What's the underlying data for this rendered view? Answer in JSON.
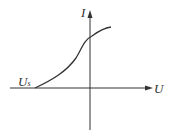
{
  "diagram": {
    "title": "",
    "axes": {
      "x_label": "U",
      "y_label": "I"
    },
    "annotations": [
      {
        "text": "U",
        "subscript": "s",
        "position": "x-intercept of curve (negative U)"
      }
    ],
    "curve": {
      "description": "I-U characteristic: zero current at U = Us (negative), rising S-shaped, crossing I-axis at positive I, saturating at larger U"
    },
    "colors": {
      "line": "#333333"
    }
  }
}
